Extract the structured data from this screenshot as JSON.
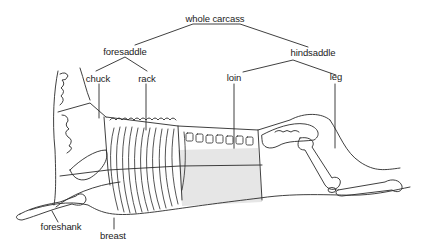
{
  "diagram": {
    "type": "hierarchy-illustration",
    "colors": {
      "line": "#2a2a2a",
      "loin_fill": "#e6e6e6",
      "background": "#ffffff"
    },
    "labels": {
      "root": "whole carcass",
      "foresaddle": "foresaddle",
      "hindsaddle": "hindsaddle",
      "chuck": "chuck",
      "rack": "rack",
      "loin": "loin",
      "leg": "leg",
      "foreshank": "foreshank",
      "breast": "breast"
    },
    "hierarchy": {
      "whole carcass": {
        "foresaddle": [
          "chuck",
          "rack"
        ],
        "hindsaddle": [
          "loin",
          "leg"
        ]
      },
      "other_cuts": [
        "foreshank",
        "breast"
      ]
    }
  }
}
